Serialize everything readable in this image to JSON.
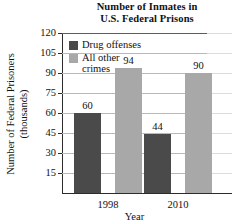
{
  "chart_data": {
    "type": "bar",
    "title": "Number of Inmates in U.S. Federal Prisons",
    "title_lines": [
      "Number of Inmates in",
      "U.S. Federal Prisons"
    ],
    "xlabel": "Year",
    "ylabel": "Number of Federal Prisoners (thousands)",
    "ylabel_lines": [
      "Number of Federal Prisoners",
      "(thousands)"
    ],
    "categories": [
      "1998",
      "2010"
    ],
    "series": [
      {
        "name": "Drug offenses",
        "name_lines": [
          "Drug offenses"
        ],
        "color": "#4a4a4a",
        "values": [
          60,
          44
        ]
      },
      {
        "name": "All other crimes",
        "name_lines": [
          "All other",
          "crimes"
        ],
        "color": "#a8a8a8",
        "values": [
          94,
          90
        ]
      }
    ],
    "data_by_group": [
      {
        "category": "1998",
        "drug_offenses": 60,
        "all_other_crimes": 44
      },
      {
        "category": "2010",
        "drug_offenses": 94,
        "all_other_crimes": 90
      }
    ],
    "bar_labels": [
      "60",
      "44",
      "94",
      "90"
    ],
    "ylim": [
      0,
      120
    ],
    "ytick_step": 15,
    "yticks": [
      15,
      30,
      45,
      60,
      75,
      90,
      105,
      120
    ],
    "ytick_labels": [
      "15",
      "30",
      "45",
      "60",
      "75",
      "90",
      "105",
      "120"
    ],
    "grid": true,
    "grid_axis": "y",
    "legend_position": "upper-left-inside",
    "value_labels_shown": true,
    "axis_color": "#2c2c2c",
    "grid_color": "#b9b9b9",
    "background": "#ffffff"
  },
  "series_values": {
    "drug_1998": "60",
    "other_1998": "44",
    "drug_2010": "94",
    "other_2010": "90"
  }
}
